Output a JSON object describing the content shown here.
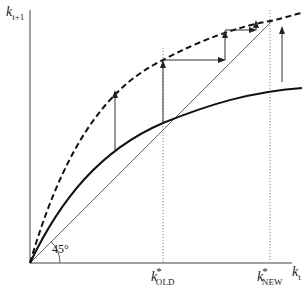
{
  "diagram": {
    "type": "solow-growth-steady-state-shift",
    "y_axis_label": {
      "var": "k",
      "subscript": "t+1"
    },
    "x_axis_label": {
      "var": "k",
      "subscript": "t"
    },
    "angle_label": "45°",
    "steady_states": [
      {
        "var": "k",
        "superscript": "*",
        "subscript": "OLD"
      },
      {
        "var": "k",
        "superscript": "*",
        "subscript": "NEW"
      }
    ],
    "curves": [
      {
        "name": "old-transition-curve",
        "style": "solid"
      },
      {
        "name": "new-transition-curve",
        "style": "dashed"
      },
      {
        "name": "45-degree-line",
        "style": "thin solid"
      }
    ],
    "colors": {
      "line": "#111111",
      "thin": "#555555",
      "dotted": "#888888"
    }
  }
}
